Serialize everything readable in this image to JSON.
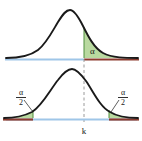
{
  "figure": {
    "title": "",
    "background_color": "#ffffff"
  },
  "colors": {
    "curve": "#1a1a1a",
    "shade_fill": "#b9d9a0",
    "shade_stroke": "#4e8f3c",
    "axis_blue": "#9fc6e8",
    "axis_red": "#8c3b2e",
    "dashed_line": "#9a9a9a",
    "label_text": "#1a1a1a"
  },
  "top_plot": {
    "name": "one-tailed-distribution",
    "curve_peak_x": 68,
    "baseline_y": 58,
    "critical_x": 84,
    "shaded_region_label": "α",
    "shaded_region_label_x": 90,
    "shaded_region_label_y": 53,
    "axis_blue_from_x": 6,
    "axis_blue_to_x": 84,
    "axis_red_from_x": 84,
    "axis_red_to_x": 138
  },
  "bottom_plot": {
    "name": "two-tailed-distribution",
    "curve_peak_x": 72,
    "baseline_y": 118,
    "left_critical_x": 33,
    "right_critical_x": 109,
    "left_region_label_numerator": "α",
    "left_region_label_denominator": "2",
    "right_region_label_numerator": "α",
    "right_region_label_denominator": "2",
    "left_label_x": 21,
    "left_label_y": 95,
    "right_label_x": 123,
    "right_label_y": 95,
    "axis_blue_from_x": 6,
    "axis_blue_to_x": 136,
    "axis_red_left_from_x": 4,
    "axis_red_left_to_x": 33,
    "axis_red_right_from_x": 109,
    "axis_red_right_to_x": 138
  },
  "critical_value": {
    "label": "k",
    "x": 84,
    "label_y": 133,
    "dashed_from_y": 58,
    "dashed_to_y": 122
  }
}
